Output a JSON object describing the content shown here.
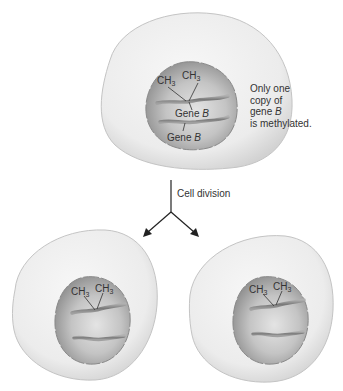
{
  "diagram": {
    "parent_cell": {
      "methyl_labels": [
        "CH",
        "CH"
      ],
      "methyl_subscript": "3",
      "gene_labels": [
        {
          "text": "Gene ",
          "italic": "B"
        },
        {
          "text": "Gene ",
          "italic": "B"
        }
      ]
    },
    "annotation": {
      "lines": [
        "Only one",
        "copy of",
        "gene ",
        "is methylated."
      ],
      "italic_in_line_3": "B"
    },
    "arrow_label": "Cell division",
    "daughter_cells": [
      {
        "methyl_labels": [
          "CH",
          "CH"
        ],
        "methyl_subscript": "3"
      },
      {
        "methyl_labels": [
          "CH",
          "CH"
        ],
        "methyl_subscript": "3"
      }
    ],
    "colors": {
      "cytoplasm": "#ececec",
      "cytoplasm_edge": "#bdbdbd",
      "nucleus": "#a8a8a8",
      "nucleus_light": "#d6d6d6",
      "dna_strand": "#8a8a8a",
      "arrow": "#222222"
    }
  }
}
